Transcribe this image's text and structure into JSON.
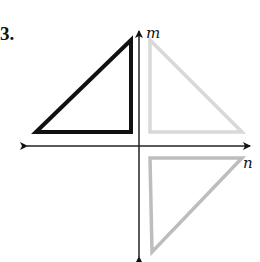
{
  "problem": {
    "number_label": "3."
  },
  "axes": {
    "vertical": {
      "label": "m",
      "color": "#222222"
    },
    "horizontal": {
      "label": "n",
      "color": "#222222"
    }
  },
  "figures": [
    {
      "name": "original-triangle",
      "quadrant": "II",
      "stroke": "#111111",
      "vertices": [
        [
          36,
          132
        ],
        [
          131,
          40
        ],
        [
          131,
          132
        ]
      ]
    },
    {
      "name": "reflected-over-m",
      "quadrant": "I",
      "stroke": "#d9d9d9",
      "vertices": [
        [
          150,
          40
        ],
        [
          150,
          132
        ],
        [
          242,
          132
        ]
      ]
    },
    {
      "name": "rotated-image",
      "quadrant": "IV",
      "stroke": "#bdbdbd",
      "vertices": [
        [
          150,
          158
        ],
        [
          242,
          158
        ],
        [
          152,
          252
        ]
      ]
    }
  ]
}
